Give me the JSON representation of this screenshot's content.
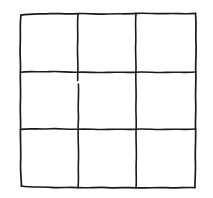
{
  "figure": {
    "kind": "line-drawing",
    "title": "",
    "caption": "",
    "canvas": {
      "width": 213,
      "height": 198,
      "background_color": "#FFFFFF"
    },
    "style": {
      "stroke_color": "#1A1A1A",
      "stroke_width": 1.6,
      "stroke_width_border": 1.7,
      "texture": "wavy hand-drawn ink line",
      "fill": "none"
    },
    "grid": {
      "rows": 3,
      "columns": 3,
      "cell_count": 9,
      "bounds": {
        "left": 20,
        "top": 13,
        "right": 196,
        "bottom": 188
      },
      "interior_vertical_x": [
        78,
        136
      ],
      "interior_horizontal_y": [
        72,
        129
      ],
      "has_line_break": true,
      "break_note": "first interior vertical line has a small gap just below the upper interior horizontal line"
    },
    "paths": {
      "border_top": "M 21.0 15.2 C 30 13.4, 40 14.2, 50 13.6 C 58 13.2, 66 14.4, 78.0 13.6 C 88 13.0, 98 14.6, 108 14.0 C 118 13.4, 127 14.2, 136.0 13.4 C 146 12.7, 156 14.2, 166 13.6 C 176 13.1, 186 14.4, 195.5 13.4",
      "border_bottom": "M 21.5 186.0 C 31 187.6, 41 186.6, 51 187.4 C 60 188.1, 69 186.9, 78.0 187.6 C 88 188.3, 98 186.8, 108 187.6 C 118 188.3, 127 187.0, 136.0 187.8 C 146 188.5, 156 187.0, 166 187.7 C 176 188.3, 186 187.1, 195.0 187.6",
      "border_left": "M 21.0 15.0 C 19.6 25, 20.8 35, 20.2 45 C 19.7 55, 20.9 64, 20.4 72.0 C 20.0 82, 21.0 92, 20.4 102 C 19.9 112, 21.0 121, 20.5 129.0 C 20.1 140, 21.2 151, 20.6 162 C 20.2 172, 21.4 180, 21.5 186.2",
      "border_right": "M 195.5 13.6 C 196.6 24, 195.4 34, 196.0 44 C 196.5 54, 195.3 63, 195.8 72.0 C 196.2 82, 195.2 92, 195.7 102 C 196.1 112, 195.1 121, 195.6 129.0 C 196.0 140, 194.9 151, 195.4 162 C 195.8 172, 194.8 181, 195.0 187.4",
      "interior_vertical_1_upper": "M 78.0 13.8 C 77.0 24, 78.2 34, 77.6 44 C 77.1 54, 78.3 63, 77.8 72.2 C 77.5 76, 78.0 78, 77.6 80.5",
      "interior_vertical_1_lower": "M 78.4 84.0 C 79.0 94, 77.8 104, 78.4 114 C 78.9 122, 77.7 125, 78.2 129.2 C 77.8 140, 79.0 151, 78.4 162 C 78.0 172, 79.0 181, 78.0 187.6",
      "interior_vertical_2": "M 136.0 13.6 C 135.0 24, 136.2 34, 135.7 44 C 135.2 54, 136.4 63, 135.9 72.2 C 135.5 82, 136.5 92, 136.0 102 C 135.6 112, 136.6 121, 136.1 129.2 C 135.7 140, 136.8 151, 136.2 162 C 135.8 172, 136.8 181, 136.0 187.8",
      "interior_horizontal_1": "M 20.4 72.2 C 30 70.8, 40 72.4, 50 71.6 C 59 70.9, 68 72.6, 77.8 72.2 C 88 71.8, 98 73.0, 108 72.4 C 118 71.8, 127 72.8, 135.9 72.2 C 146 71.6, 156 73.0, 166 72.4 C 176 71.9, 186 72.8, 195.8 72.0",
      "interior_horizontal_2": "M 20.5 129.4 C 30 128.0, 40 129.6, 50 128.8 C 59 128.1, 68 129.8, 78.2 129.2 C 88 128.7, 98 130.0, 108 129.4 C 118 128.8, 127 129.8, 136.1 129.2 C 146 128.6, 156 130.0, 166 129.4 C 176 128.9, 186 129.8, 195.6 129.0"
    },
    "cells": [
      {
        "id": "cell-r1c1",
        "row": 1,
        "column": 1,
        "content": ""
      },
      {
        "id": "cell-r1c2",
        "row": 1,
        "column": 2,
        "content": ""
      },
      {
        "id": "cell-r1c3",
        "row": 1,
        "column": 3,
        "content": ""
      },
      {
        "id": "cell-r2c1",
        "row": 2,
        "column": 1,
        "content": ""
      },
      {
        "id": "cell-r2c2",
        "row": 2,
        "column": 2,
        "content": ""
      },
      {
        "id": "cell-r2c3",
        "row": 2,
        "column": 3,
        "content": ""
      },
      {
        "id": "cell-r3c1",
        "row": 3,
        "column": 1,
        "content": ""
      },
      {
        "id": "cell-r3c2",
        "row": 3,
        "column": 2,
        "content": ""
      },
      {
        "id": "cell-r3c3",
        "row": 3,
        "column": 3,
        "content": ""
      }
    ]
  }
}
